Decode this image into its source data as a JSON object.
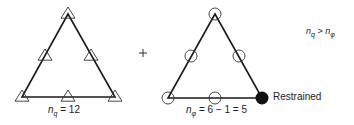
{
  "figure": {
    "left_element": {
      "description": "Triangular element with displacement nodes",
      "node_symbol": "triangle",
      "node_count": 6,
      "label": {
        "var": "n",
        "sub": "q",
        "rest": " = 12"
      }
    },
    "operator": "+",
    "right_element": {
      "description": "Triangular element with rotation nodes",
      "node_symbol": "circle",
      "node_count": 6,
      "restrained_node_count": 1,
      "restrained_label": "Restrained",
      "label": {
        "var": "n",
        "sub": "φ",
        "rest": " = 6 − 1 = 5"
      }
    },
    "comparison": {
      "lhs_var": "n",
      "lhs_sub": "q",
      "op": " > ",
      "rhs_var": "n",
      "rhs_sub": "φ"
    }
  },
  "colors": {
    "line": "#1a1a1a",
    "restrained_fill": "#111111"
  }
}
